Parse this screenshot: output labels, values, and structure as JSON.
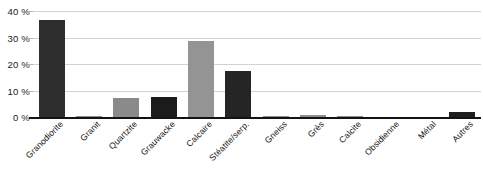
{
  "chart_data": {
    "type": "bar",
    "title": "",
    "subtitle": "",
    "xlabel": "",
    "ylabel": "",
    "ylim": [
      0,
      40
    ],
    "ytick_labels": [
      "0 %",
      "10 %",
      "20 %",
      "30 %",
      "40 %"
    ],
    "ytick_values": [
      0,
      10,
      20,
      30,
      40
    ],
    "grid": true,
    "legend": "none",
    "categories": [
      "Granodiorite",
      "Granit",
      "Quartzite",
      "Grauwacke",
      "Calcaire",
      "Stéatite/serp.",
      "Gneiss",
      "Grès",
      "Calcite",
      "Obsidienne",
      "Métal",
      "Autres"
    ],
    "values": [
      36.5,
      0.3,
      7.0,
      7.5,
      28.5,
      17.5,
      0.4,
      0.6,
      0.2,
      0.0,
      0.0,
      2.0
    ],
    "bar_colors": [
      "#2e2e2e",
      "#8c8c8c",
      "#8a8a8a",
      "#1b1b1b",
      "#949494",
      "#252525",
      "#8a8a8a",
      "#8f8f8f",
      "#8a8a8a",
      "#2b2b2b",
      "#2b2b2b",
      "#1e1e1e"
    ]
  },
  "axis": {
    "gridline_color": "#d3d3d3",
    "baseline_color": "#131313",
    "tick_color": "#b5b5b5"
  }
}
